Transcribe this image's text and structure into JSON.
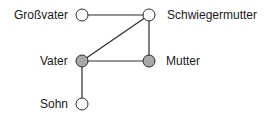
{
  "diagram": {
    "type": "family-graph",
    "nodes": [
      {
        "id": "grossvater",
        "label": "Großvater",
        "x": 82,
        "y": 15,
        "filled": false
      },
      {
        "id": "schwiegermutter",
        "label": "Schwiegermutter",
        "x": 149,
        "y": 15,
        "filled": false
      },
      {
        "id": "vater",
        "label": "Vater",
        "x": 82,
        "y": 61,
        "filled": true
      },
      {
        "id": "mutter",
        "label": "Mutter",
        "x": 149,
        "y": 61,
        "filled": true
      },
      {
        "id": "sohn",
        "label": "Sohn",
        "x": 82,
        "y": 104,
        "filled": false
      }
    ],
    "edges": [
      [
        "grossvater",
        "schwiegermutter"
      ],
      [
        "schwiegermutter",
        "vater"
      ],
      [
        "schwiegermutter",
        "mutter"
      ],
      [
        "vater",
        "mutter"
      ],
      [
        "vater",
        "sohn"
      ]
    ],
    "colors": {
      "line": "#2a2a2a",
      "filled_node": "#a8a8a8",
      "empty_node": "#ffffff"
    }
  }
}
